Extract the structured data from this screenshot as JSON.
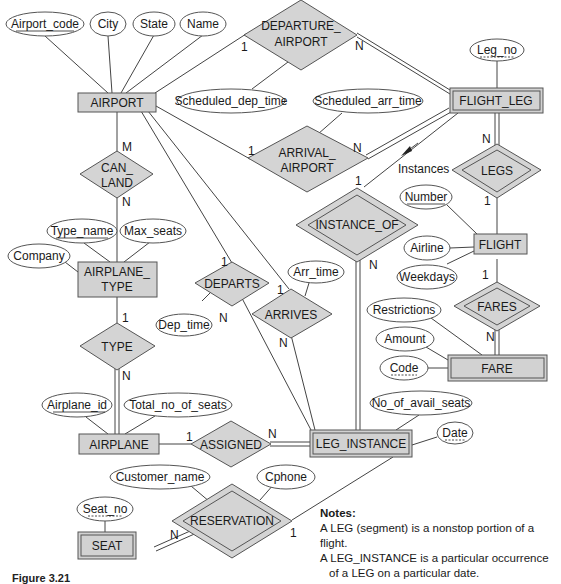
{
  "entities": {
    "airport": "AIRPORT",
    "flight_leg": "FLIGHT_LEG",
    "flight": "FLIGHT",
    "fare": "FARE",
    "airplane_type_1": "AIRPLANE_",
    "airplane_type_2": "TYPE",
    "airplane": "AIRPLANE",
    "leg_instance": "LEG_INSTANCE",
    "seat": "SEAT"
  },
  "relationships": {
    "departure_airport_1": "DEPARTURE_",
    "departure_airport_2": "AIRPORT",
    "arrival_airport_1": "ARRIVAL_",
    "arrival_airport_2": "AIRPORT",
    "can_land_1": "CAN_",
    "can_land_2": "LAND",
    "legs": "LEGS",
    "instance_of": "INSTANCE_OF",
    "fares": "FARES",
    "departs": "DEPARTS",
    "arrives": "ARRIVES",
    "type": "TYPE",
    "assigned": "ASSIGNED",
    "reservation": "RESERVATION"
  },
  "attributes": {
    "airport_code": "Airport_code",
    "city": "City",
    "state": "State",
    "name": "Name",
    "scheduled_dep_time": "Scheduled_dep_time",
    "scheduled_arr_time": "Scheduled_arr_time",
    "leg_no": "Leg_no",
    "number": "Number",
    "airline": "Airline",
    "weekdays": "Weekdays",
    "restrictions": "Restrictions",
    "amount": "Amount",
    "code": "Code",
    "type_name": "Type_name",
    "max_seats": "Max_seats",
    "company": "Company",
    "dep_time": "Dep_time",
    "arr_time": "Arr_time",
    "airplane_id": "Airplane_id",
    "total_no_of_seats": "Total_no_of_seats",
    "no_of_avail_seats": "No_of_avail_seats",
    "date": "Date",
    "customer_name": "Customer_name",
    "cphone": "Cphone",
    "seat_no": "Seat_no"
  },
  "cardinalities": {
    "dep_airport_airport": "1",
    "dep_airport_leg": "N",
    "arr_airport_airport": "1",
    "arr_airport_leg": "N",
    "can_land_airport": "M",
    "can_land_type": "N",
    "legs_leg": "N",
    "legs_flight": "1",
    "instance_of_leg": "1",
    "instance_of_inst": "N",
    "fares_flight": "1",
    "fares_fare": "N",
    "departs_airport": "1",
    "departs_inst": "N",
    "arrives_airport": "1",
    "arrives_inst": "N",
    "type_type": "1",
    "type_airplane": "N",
    "assigned_airplane": "1",
    "assigned_inst": "N",
    "reservation_seat": "N",
    "reservation_inst": "1"
  },
  "annotations": {
    "instances": "Instances"
  },
  "notes": {
    "title": "Notes:",
    "line1": "A LEG (segment) is a nonstop portion of a flight.",
    "line2": "A LEG_INSTANCE is a particular occurrence",
    "line3": "of a LEG on a particular date."
  },
  "caption": "Figure 3.21"
}
